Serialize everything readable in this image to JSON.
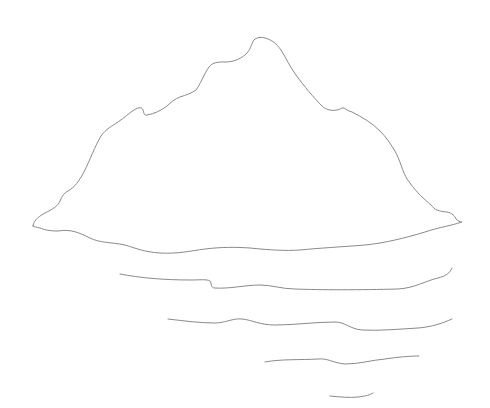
{
  "drawing": {
    "subject": "Line sketch of a mountainous island with reflection lines on water",
    "background_color": "#ffffff",
    "stroke_color": "#8a8a8a",
    "elements": [
      {
        "name": "island-outline",
        "kind": "closed-outline"
      },
      {
        "name": "water-line-1",
        "kind": "wave-stroke"
      },
      {
        "name": "water-line-2",
        "kind": "wave-stroke"
      },
      {
        "name": "water-line-3",
        "kind": "wave-stroke"
      },
      {
        "name": "water-line-4",
        "kind": "wave-stroke"
      }
    ]
  }
}
